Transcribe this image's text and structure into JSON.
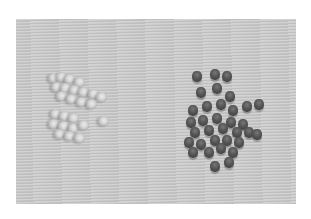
{
  "image": {
    "description": "Photograph of two groups of small cylindrical beads on a gray textured surface: translucent/clear beads on the left, dark gray beads on the right",
    "colors": {
      "border": "#ffffff",
      "surface": "#c9c9c9",
      "dark_bead": "#4a4a4a",
      "clear_bead": "#dcdcdc"
    },
    "groups": [
      {
        "name": "clear-beads",
        "position": "left",
        "approx_count": 22
      },
      {
        "name": "dark-beads",
        "position": "right",
        "approx_count": 38
      }
    ]
  }
}
